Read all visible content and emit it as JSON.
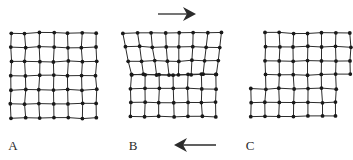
{
  "figure": {
    "background_color": "#ffffff",
    "line_color": "#2b2b2b",
    "node_color": "#1a1a1a",
    "node_radius": 1.9,
    "line_width": 1.0,
    "lattice_spacing": 14.2
  },
  "panels": [
    {
      "id": "A",
      "label": "A",
      "label_x": 13,
      "label_y": 150,
      "caption": "Perfect crystal lattice before slip",
      "origin_x": 11,
      "origin_y": 33,
      "columns": 6,
      "rows": 6,
      "state": "perfect-lattice"
    },
    {
      "id": "B",
      "label": "B",
      "label_x": 133,
      "label_y": 150,
      "caption": "Edge dislocation with extra half-plane at crystal centre under shear",
      "origin_x": 131,
      "origin_y": 33,
      "columns": 6,
      "rows": 6,
      "state": "edge-dislocation"
    },
    {
      "id": "C",
      "label": "C",
      "label_x": 250,
      "label_y": 150,
      "caption": "Crystal after slip has passed through, leaving a surface step",
      "origin_x": 251,
      "origin_y": 33,
      "columns": 6,
      "rows": 6,
      "state": "slipped-stepped"
    }
  ],
  "arrows": [
    {
      "id": "top-shear-arrow",
      "name": "arrow-right-top",
      "direction": "right",
      "tail_x": 158,
      "tail_y": 14,
      "head_x": 196,
      "head_y": 14,
      "head_length": 13,
      "head_half_width": 7,
      "meaning": "Shear force applied to the top half of the crystal, pointing right"
    },
    {
      "id": "bottom-shear-arrow",
      "name": "arrow-left-bottom",
      "direction": "left",
      "tail_x": 216,
      "tail_y": 145,
      "head_x": 174,
      "head_y": 145,
      "head_length": 13,
      "head_half_width": 7,
      "meaning": "Shear force applied to the bottom half of the crystal, pointing left"
    }
  ]
}
